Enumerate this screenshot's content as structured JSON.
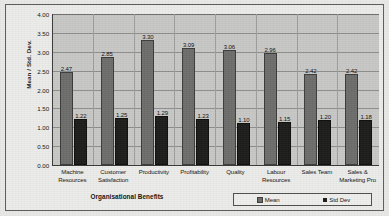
{
  "chart_data": {
    "type": "bar",
    "title": "",
    "xlabel": "Organisational Benefits",
    "ylabel": "Mean / Std. Dev.",
    "ylim": [
      0.0,
      4.0
    ],
    "ytick_step": 0.5,
    "ytick_labels": [
      "4.00",
      "3.50",
      "3.00",
      "2.50",
      "2.00",
      "1.50",
      "1.00",
      "0.50",
      "0.00"
    ],
    "ytick_values": [
      4.0,
      3.5,
      3.0,
      2.5,
      2.0,
      1.5,
      1.0,
      0.5,
      0.0
    ],
    "grid": true,
    "legend_position": "bottom-right",
    "categories": [
      "Machine Resources",
      "Customer Satisfaction",
      "Productivity",
      "Profitability",
      "Quality",
      "Labour Resources",
      "Sales Team",
      "Sales & Marketing Pro"
    ],
    "category_lines": [
      [
        "Machine",
        "Resources"
      ],
      [
        "Customer",
        "Satisfaction"
      ],
      [
        "Productivity"
      ],
      [
        "Profitability"
      ],
      [
        "Quality"
      ],
      [
        "Labour",
        "Resources"
      ],
      [
        "Sales Team"
      ],
      [
        "Sales &",
        "Marketing Pro"
      ]
    ],
    "series": [
      {
        "name": "Mean",
        "color": "#6e6e6c",
        "values": [
          2.47,
          2.85,
          3.3,
          3.09,
          3.06,
          2.96,
          2.42,
          2.42
        ],
        "labels": [
          "2.47",
          "2.85",
          "3.30",
          "3.09",
          "3.06",
          "2.96",
          "2.42",
          "2.42"
        ]
      },
      {
        "name": "Std Dev",
        "color": "#1d1d1b",
        "values": [
          1.22,
          1.25,
          1.29,
          1.23,
          1.1,
          1.15,
          1.2,
          1.18
        ],
        "labels": [
          "1.22",
          "1.25",
          "1.29",
          "1.23",
          "1.10",
          "1.15",
          "1.20",
          "1.18"
        ]
      }
    ]
  },
  "legend": {
    "entries": [
      {
        "label": "Mean"
      },
      {
        "label": "Std Dev"
      }
    ]
  }
}
